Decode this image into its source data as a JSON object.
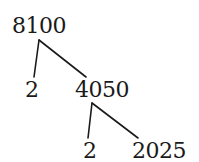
{
  "diagram": {
    "type": "factor-tree",
    "root": {
      "value": "8100",
      "children": [
        {
          "value": "2"
        },
        {
          "value": "4050",
          "children": [
            {
              "value": "2"
            },
            {
              "value": "2025"
            }
          ]
        }
      ]
    },
    "nodes": {
      "root": "8100",
      "level1_left": "2",
      "level1_right": "4050",
      "level2_left": "2",
      "level2_right": "2025"
    },
    "colors": {
      "text": "#1a1a1a",
      "lines": "#1a1a1a",
      "background": "#ffffff"
    }
  }
}
